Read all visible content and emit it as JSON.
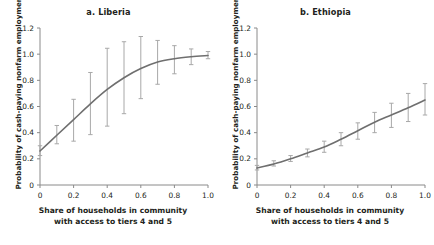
{
  "figure": {
    "background": "#ffffff",
    "line_color": "#6f6f6f",
    "error_bar_color": "#a8a8a8",
    "axis_color": "#8a8a8a",
    "text_color": "#231f20"
  },
  "panels": [
    {
      "key": "liberia",
      "title": "a. Liberia",
      "xlabel_line1": "Share of households in community",
      "xlabel_line2": "with access to tiers 4 and 5",
      "ylabel": "Probability of cash-paying nonfarm employment"
    },
    {
      "key": "ethiopia",
      "title": "b. Ethiopia",
      "xlabel_line1": "Share of households in community",
      "xlabel_line2": "with access to tiers 4 and 5",
      "ylabel": "Probability of cash-paying nonfarm employment"
    }
  ],
  "axis": {
    "xticks": [
      "0",
      "0.2",
      "0.4",
      "0.6",
      "0.8",
      "1.0"
    ],
    "xtick_values": [
      0,
      0.2,
      0.4,
      0.6,
      0.8,
      1.0
    ],
    "yticks": [
      "0",
      "0.2",
      "0.4",
      "0.6",
      "0.8",
      "1.0",
      "1.2"
    ],
    "ytick_values": [
      0,
      0.2,
      0.4,
      0.6,
      0.8,
      1.0,
      1.2
    ],
    "xlim": [
      0,
      1.0
    ],
    "ylim": [
      0,
      1.2
    ],
    "grid": false
  },
  "chart_data": [
    {
      "type": "line",
      "panel": "a",
      "title": "a. Liberia",
      "xlabel": "Share of households in community with access to tiers 4 and 5",
      "ylabel": "Probability of cash-paying nonfarm employment",
      "xlim": [
        0,
        1.0
      ],
      "ylim": [
        0,
        1.2
      ],
      "grid": false,
      "legend": "none",
      "x": [
        0.0,
        0.1,
        0.2,
        0.3,
        0.4,
        0.5,
        0.6,
        0.7,
        0.8,
        0.9,
        1.0
      ],
      "values": [
        0.26,
        0.38,
        0.5,
        0.62,
        0.73,
        0.82,
        0.89,
        0.94,
        0.965,
        0.98,
        0.99
      ],
      "error_low": [
        0.225,
        0.315,
        0.335,
        0.385,
        0.45,
        0.545,
        0.66,
        0.77,
        0.85,
        0.92,
        0.965
      ],
      "error_high": [
        0.3,
        0.455,
        0.655,
        0.86,
        1.045,
        1.095,
        1.135,
        1.105,
        1.065,
        1.04,
        1.02
      ]
    },
    {
      "type": "line",
      "panel": "b",
      "title": "b. Ethiopia",
      "xlabel": "Share of households in community with access to tiers 4 and 5",
      "ylabel": "Probability of cash-paying nonfarm employment",
      "xlim": [
        0,
        1.0
      ],
      "ylim": [
        0,
        1.2
      ],
      "grid": false,
      "legend": "none",
      "x": [
        0.0,
        0.1,
        0.2,
        0.3,
        0.4,
        0.5,
        0.6,
        0.7,
        0.8,
        0.9,
        1.0
      ],
      "values": [
        0.13,
        0.16,
        0.2,
        0.245,
        0.29,
        0.35,
        0.415,
        0.48,
        0.535,
        0.59,
        0.65
      ],
      "error_low": [
        0.115,
        0.145,
        0.18,
        0.215,
        0.25,
        0.3,
        0.35,
        0.4,
        0.44,
        0.485,
        0.535
      ],
      "error_high": [
        0.15,
        0.185,
        0.225,
        0.275,
        0.335,
        0.4,
        0.475,
        0.555,
        0.625,
        0.7,
        0.775
      ]
    }
  ]
}
